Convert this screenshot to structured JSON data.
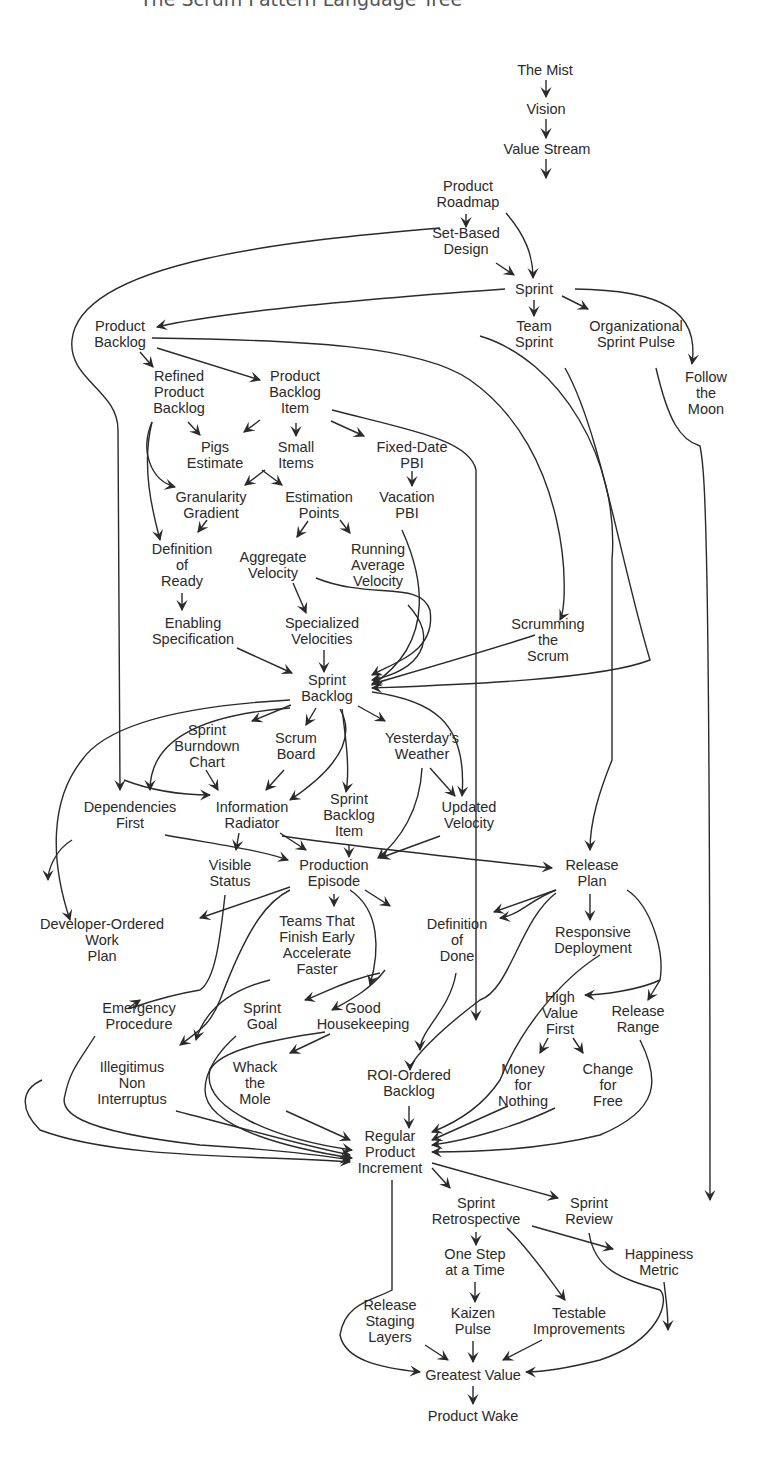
{
  "header": {
    "title": "The Scrum Pattern Language Tree"
  },
  "diagram": {
    "line_color": "#2a2a2a",
    "nodes": [
      {
        "id": "mist",
        "label": "The Mist",
        "x": 545,
        "y": 70
      },
      {
        "id": "vision",
        "label": "Vision",
        "x": 546,
        "y": 109
      },
      {
        "id": "valuestream",
        "label": "Value Stream",
        "x": 547,
        "y": 149
      },
      {
        "id": "roadmap",
        "label": "Product\nRoadmap",
        "x": 468,
        "y": 194,
        "cx": 467
      },
      {
        "id": "setbased",
        "label": "Set-Based\nDesign",
        "x": 466,
        "y": 241
      },
      {
        "id": "sprint",
        "label": "Sprint",
        "x": 534,
        "y": 289
      },
      {
        "id": "productbacklog",
        "label": "Product\nBacklog",
        "x": 120,
        "y": 334
      },
      {
        "id": "teamsprint",
        "label": "Team\nSprint",
        "x": 534,
        "y": 334
      },
      {
        "id": "orgpulse",
        "label": "Organizational\nSprint Pulse",
        "x": 636,
        "y": 334
      },
      {
        "id": "followmoon",
        "label": "Follow\nthe\nMoon",
        "x": 706,
        "y": 393
      },
      {
        "id": "refined",
        "label": "Refined\nProduct\nBacklog",
        "x": 179,
        "y": 392
      },
      {
        "id": "pbi",
        "label": "Product\nBacklog\nItem",
        "x": 295,
        "y": 392
      },
      {
        "id": "pigs",
        "label": "Pigs\nEstimate",
        "x": 215,
        "y": 455
      },
      {
        "id": "smallitems",
        "label": "Small\nItems",
        "x": 296,
        "y": 455
      },
      {
        "id": "fixeddate",
        "label": "Fixed-Date\nPBI",
        "x": 412,
        "y": 455
      },
      {
        "id": "granularity",
        "label": "Granularity\nGradient",
        "x": 211,
        "y": 505
      },
      {
        "id": "estpoints",
        "label": "Estimation\nPoints",
        "x": 319,
        "y": 505
      },
      {
        "id": "vacation",
        "label": "Vacation\nPBI",
        "x": 407,
        "y": 505
      },
      {
        "id": "dor",
        "label": "Definition\nof\nReady",
        "x": 182,
        "y": 565
      },
      {
        "id": "aggvel",
        "label": "Aggregate\nVelocity",
        "x": 273,
        "y": 565
      },
      {
        "id": "runavg",
        "label": "Running\nAverage\nVelocity",
        "x": 378,
        "y": 565
      },
      {
        "id": "enabling",
        "label": "Enabling\nSpecification",
        "x": 193,
        "y": 631
      },
      {
        "id": "specvel",
        "label": "Specialized\nVelocities",
        "x": 322,
        "y": 631
      },
      {
        "id": "scrumming",
        "label": "Scrumming\nthe\nScrum",
        "x": 548,
        "y": 640
      },
      {
        "id": "sprintbacklog",
        "label": "Sprint\nBacklog",
        "x": 327,
        "y": 688
      },
      {
        "id": "burndown",
        "label": "Sprint\nBurndown\nChart",
        "x": 207,
        "y": 746
      },
      {
        "id": "scrumboard",
        "label": "Scrum\nBoard",
        "x": 296,
        "y": 746
      },
      {
        "id": "yesterday",
        "label": "Yesterday's\nWeather",
        "x": 422,
        "y": 746
      },
      {
        "id": "depfirst",
        "label": "Dependencies\nFirst",
        "x": 130,
        "y": 815
      },
      {
        "id": "inforad",
        "label": "Information\nRadiator",
        "x": 252,
        "y": 815
      },
      {
        "id": "sbi",
        "label": "Sprint\nBacklog\nItem",
        "x": 349,
        "y": 815
      },
      {
        "id": "updvel",
        "label": "Updated\nVelocity",
        "x": 469,
        "y": 815
      },
      {
        "id": "visible",
        "label": "Visible\nStatus",
        "x": 230,
        "y": 873
      },
      {
        "id": "prodepisode",
        "label": "Production\nEpisode",
        "x": 334,
        "y": 873
      },
      {
        "id": "releaseplan",
        "label": "Release\nPlan",
        "x": 592,
        "y": 873
      },
      {
        "id": "devordered",
        "label": "Developer-Ordered\nWork\nPlan",
        "x": 102,
        "y": 940
      },
      {
        "id": "teamsfinish",
        "label": "Teams That\nFinish Early\nAccelerate\nFaster",
        "x": 317,
        "y": 945
      },
      {
        "id": "dod",
        "label": "Definition\nof\nDone",
        "x": 457,
        "y": 940
      },
      {
        "id": "responsive",
        "label": "Responsive\nDeployment",
        "x": 593,
        "y": 940
      },
      {
        "id": "emergency",
        "label": "Emergency\nProcedure",
        "x": 139,
        "y": 1016
      },
      {
        "id": "sprintgoal",
        "label": "Sprint\nGoal",
        "x": 262,
        "y": 1016
      },
      {
        "id": "housekeeping",
        "label": "Good\nHousekeeping",
        "x": 363,
        "y": 1016
      },
      {
        "id": "highvalue",
        "label": "High\nValue\nFirst",
        "x": 560,
        "y": 1013
      },
      {
        "id": "releaserange",
        "label": "Release\nRange",
        "x": 638,
        "y": 1019
      },
      {
        "id": "illegitimus",
        "label": "Illegitimus\nNon\nInterruptus",
        "x": 132,
        "y": 1083
      },
      {
        "id": "whack",
        "label": "Whack\nthe\nMole",
        "x": 255,
        "y": 1083
      },
      {
        "id": "roi",
        "label": "ROI-Ordered\nBacklog",
        "x": 409,
        "y": 1083
      },
      {
        "id": "money",
        "label": "Money\nfor\nNothing",
        "x": 523,
        "y": 1085
      },
      {
        "id": "changefree",
        "label": "Change\nfor\nFree",
        "x": 608,
        "y": 1085
      },
      {
        "id": "rpi",
        "label": "Regular\nProduct\nIncrement",
        "x": 390,
        "y": 1152
      },
      {
        "id": "retro",
        "label": "Sprint\nRetrospective",
        "x": 476,
        "y": 1211
      },
      {
        "id": "review",
        "label": "Sprint\nReview",
        "x": 589,
        "y": 1211
      },
      {
        "id": "onestep",
        "label": "One Step\nat a Time",
        "x": 475,
        "y": 1262
      },
      {
        "id": "happiness",
        "label": "Happiness\nMetric",
        "x": 659,
        "y": 1262
      },
      {
        "id": "staging",
        "label": "Release\nStaging\nLayers",
        "x": 390,
        "y": 1321
      },
      {
        "id": "kaizen",
        "label": "Kaizen\nPulse",
        "x": 473,
        "y": 1321
      },
      {
        "id": "testable",
        "label": "Testable\nImprovements",
        "x": 579,
        "y": 1321
      },
      {
        "id": "greatest",
        "label": "Greatest Value",
        "x": 473,
        "y": 1375
      },
      {
        "id": "wake",
        "label": "Product Wake",
        "x": 473,
        "y": 1416
      }
    ]
  }
}
